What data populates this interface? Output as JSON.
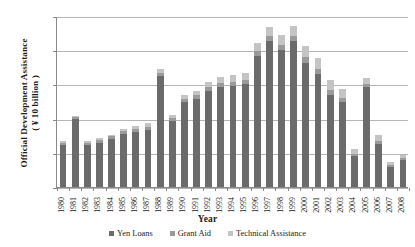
{
  "chart_data": {
    "type": "bar",
    "subtype": "stacked-bar",
    "title": "",
    "xlabel": "Year",
    "ylabel": "Official Development Assistance ( ¥ 10 billion )",
    "ylabel_line1": "Official Development Assistance",
    "ylabel_line2": "( ¥ 10 billion )",
    "ylim": [
      0,
      25
    ],
    "yticks": [
      0,
      5,
      10,
      15,
      20,
      25
    ],
    "grid": true,
    "grid_axis": "y",
    "legend_position": "bottom",
    "categories": [
      "1980",
      "1981",
      "1982",
      "1983",
      "1984",
      "1985",
      "1986",
      "1987",
      "1988",
      "1989",
      "1990",
      "1991",
      "1992",
      "1993",
      "1994",
      "1995",
      "1996",
      "1997",
      "1998",
      "1999",
      "2000",
      "2001",
      "2002",
      "2003",
      "2004",
      "2005",
      "2006",
      "2007",
      "2008"
    ],
    "series": [
      {
        "name": "Yen Loans",
        "color": "#6b6b6b",
        "values": [
          6.2,
          9.9,
          6.2,
          6.5,
          7.0,
          7.8,
          8.0,
          8.3,
          16.2,
          9.7,
          12.4,
          12.9,
          14.0,
          14.6,
          14.8,
          15.0,
          19.2,
          21.3,
          20.0,
          21.3,
          18.2,
          16.5,
          13.5,
          12.4,
          4.6,
          14.6,
          6.3,
          2.9,
          4.0
        ]
      },
      {
        "name": "Grant Aid",
        "color": "#9a9a9a",
        "values": [
          0.3,
          0.3,
          0.3,
          0.4,
          0.4,
          0.4,
          0.5,
          0.5,
          0.5,
          0.4,
          0.5,
          0.5,
          0.6,
          0.6,
          0.6,
          0.6,
          0.7,
          0.8,
          0.8,
          0.8,
          0.8,
          0.8,
          0.7,
          0.6,
          0.3,
          0.5,
          0.5,
          0.3,
          0.3
        ]
      },
      {
        "name": "Technical Assistance",
        "color": "#c4c4c4",
        "values": [
          0.2,
          0.2,
          0.2,
          0.2,
          0.2,
          0.3,
          0.4,
          0.5,
          0.6,
          0.5,
          0.6,
          0.7,
          0.8,
          0.9,
          1.0,
          1.1,
          1.2,
          1.3,
          1.4,
          1.5,
          1.6,
          1.5,
          1.4,
          1.3,
          0.7,
          0.9,
          0.8,
          0.4,
          0.4
        ]
      }
    ]
  },
  "legend": {
    "items": [
      {
        "label": "Yen Loans",
        "color": "#6b6b6b"
      },
      {
        "label": "Grant Aid",
        "color": "#9a9a9a"
      },
      {
        "label": "Technical Assistance",
        "color": "#c4c4c4"
      }
    ]
  },
  "axes": {
    "x_title": "Year",
    "y_title_line1": "Official Development Assistance",
    "y_title_line2": "( ¥ 10 billion )"
  },
  "colors": {
    "gridline": "#b4b4b4",
    "axis": "#8a8a8a",
    "background": "#ffffff",
    "text": "#1a1a1a"
  }
}
